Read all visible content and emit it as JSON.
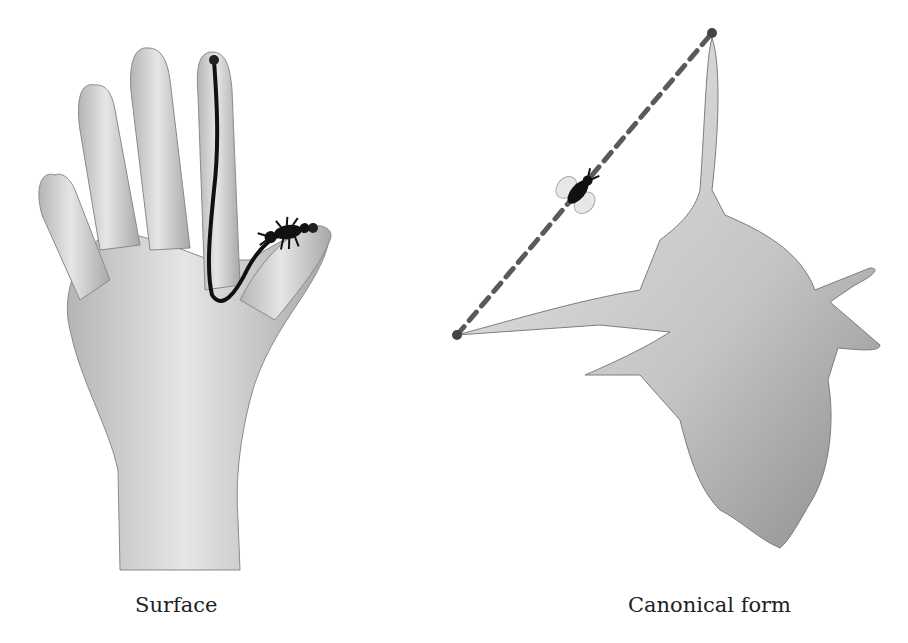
{
  "figure": {
    "left_panel": {
      "caption": "Surface",
      "shape": "hand",
      "path_style": "solid geodesic",
      "agent": "ant"
    },
    "right_panel": {
      "caption": "Canonical form",
      "shape": "canonical-form",
      "path_style": "dashed straight line",
      "agent": "fly"
    },
    "colors": {
      "surface_fill": "#d9d9d9",
      "surface_shade": "#9a9a9a",
      "geodesic": "#111111",
      "dashed_line": "#5a5a5a",
      "endpoint": "#444444"
    }
  }
}
